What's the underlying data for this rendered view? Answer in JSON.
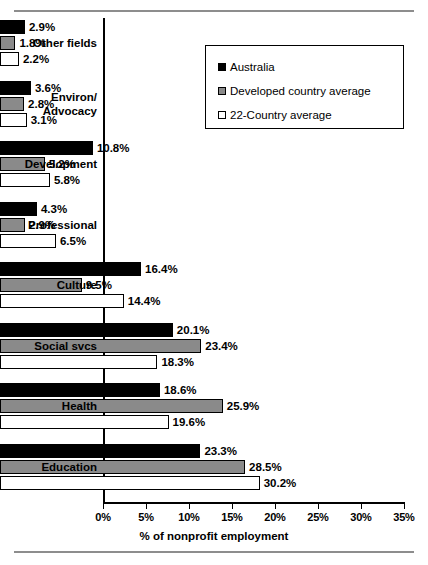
{
  "chart_data": {
    "type": "bar",
    "orientation": "horizontal",
    "title": "",
    "xlabel": "% of nonprofit employment",
    "ylabel": "",
    "xlim": [
      0,
      35
    ],
    "xticks": [
      "0%",
      "5%",
      "10%",
      "15%",
      "20%",
      "25%",
      "30%",
      "35%"
    ],
    "xtick_values": [
      0,
      5,
      10,
      15,
      20,
      25,
      30,
      35
    ],
    "grid": false,
    "legend_position": "top-right",
    "categories": [
      "Other fields",
      "Environ/ Advocacy",
      "Development",
      "Professional",
      "Culture",
      "Social svcs",
      "Health",
      "Education"
    ],
    "category_lines": [
      [
        "Other fields"
      ],
      [
        "Environ/",
        "Advocacy"
      ],
      [
        "Development"
      ],
      [
        "Professional"
      ],
      [
        "Culture"
      ],
      [
        "Social svcs"
      ],
      [
        "Health"
      ],
      [
        "Education"
      ]
    ],
    "series": [
      {
        "name": "Australia",
        "color": "#000000",
        "values": [
          2.9,
          3.6,
          10.8,
          4.3,
          16.4,
          20.1,
          18.6,
          23.3
        ],
        "labels": [
          "2.9%",
          "3.6%",
          "10.8%",
          "4.3%",
          "16.4%",
          "20.1%",
          "18.6%",
          "23.3%"
        ]
      },
      {
        "name": "Developed country average",
        "color": "#8a8a8a",
        "values": [
          1.8,
          2.8,
          5.2,
          2.9,
          9.5,
          23.4,
          25.9,
          28.5
        ],
        "labels": [
          "1.8%",
          "2.8%",
          "5.2%",
          "2.9%",
          "9.5%",
          "23.4%",
          "25.9%",
          "28.5%"
        ]
      },
      {
        "name": "22-Country average",
        "color": "#ffffff",
        "values": [
          2.2,
          3.1,
          5.8,
          6.5,
          14.4,
          18.3,
          19.6,
          30.2
        ],
        "labels": [
          "2.2%",
          "3.1%",
          "5.8%",
          "6.5%",
          "14.4%",
          "18.3%",
          "19.6%",
          "30.2%"
        ]
      }
    ]
  },
  "legend": {
    "items": [
      {
        "label": "Australia",
        "swatch": "black-square-icon"
      },
      {
        "label": "Developed country average",
        "swatch": "gray-square-icon"
      },
      {
        "label": "22-Country average",
        "swatch": "white-square-icon"
      }
    ]
  }
}
